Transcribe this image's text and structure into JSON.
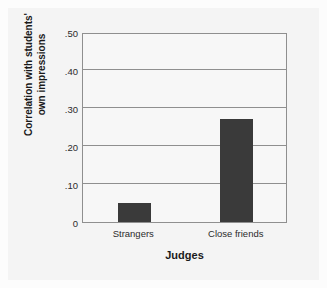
{
  "chart_data": {
    "type": "bar",
    "title": "",
    "xlabel": "Judges",
    "ylabel": "Correlation with students' own impressions",
    "ylabel_line1": "Correlation with students'",
    "ylabel_line2": "own impressions",
    "categories": [
      "Strangers",
      "Close friends"
    ],
    "values": [
      0.05,
      0.27
    ],
    "ylim": [
      0,
      0.5
    ],
    "yticks": [
      0,
      0.1,
      0.2,
      0.3,
      0.4,
      0.5
    ],
    "ytick_labels": [
      "0",
      ".10",
      ".20",
      ".30",
      ".40",
      ".50"
    ],
    "gridlines": [
      0.1,
      0.2,
      0.3,
      0.4,
      0.5
    ],
    "grid": true,
    "legend": false,
    "bar_color": "#3a3a3a",
    "grid_color": "#8f8f8f",
    "axis_color": "#8f8f8f",
    "plot_background": "#f7f7f7",
    "figure_background": "#f4f4f4"
  }
}
